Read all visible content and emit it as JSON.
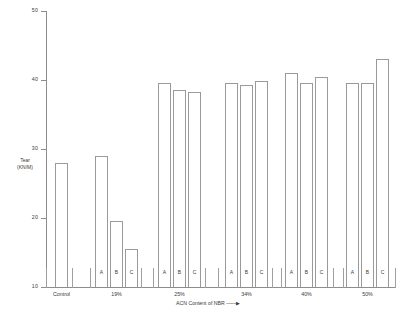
{
  "chart_data": {
    "type": "bar",
    "title": "",
    "xlabel": "ACN Content of NBR",
    "ylabel": "Tear (KN/M)",
    "ylabel_lines": [
      "Tear",
      "(KN/M)"
    ],
    "ylim": [
      10,
      50
    ],
    "yticks": [
      10,
      20,
      30,
      40,
      50
    ],
    "ytick_labels": [
      "10",
      "20",
      "30",
      "40",
      "50"
    ],
    "grid": false,
    "legend": "none",
    "xaxis_arrow": "——▶",
    "series_labels": [
      "A",
      "B",
      "C"
    ],
    "groups": [
      {
        "label": "Control",
        "bars": [
          {
            "sublabel": "",
            "value": 28.0
          }
        ]
      },
      {
        "label": "19%",
        "bars": [
          {
            "sublabel": "A",
            "value": 29.0
          },
          {
            "sublabel": "B",
            "value": 19.5
          },
          {
            "sublabel": "C",
            "value": 15.5
          }
        ]
      },
      {
        "label": "25%",
        "bars": [
          {
            "sublabel": "A",
            "value": 39.5
          },
          {
            "sublabel": "B",
            "value": 38.5
          },
          {
            "sublabel": "C",
            "value": 38.3
          }
        ]
      },
      {
        "label": "34%",
        "bars": [
          {
            "sublabel": "A",
            "value": 39.5
          },
          {
            "sublabel": "B",
            "value": 39.3
          },
          {
            "sublabel": "C",
            "value": 39.8
          }
        ]
      },
      {
        "label": "40%",
        "bars": [
          {
            "sublabel": "A",
            "value": 41.0
          },
          {
            "sublabel": "B",
            "value": 39.5
          },
          {
            "sublabel": "C",
            "value": 40.5
          }
        ]
      },
      {
        "label": "50%",
        "bars": [
          {
            "sublabel": "A",
            "value": 39.5
          },
          {
            "sublabel": "B",
            "value": 39.5
          },
          {
            "sublabel": "C",
            "value": 43.0
          }
        ]
      }
    ],
    "colors": {
      "bar_fill": "#ffffff",
      "bar_stroke": "#9a9a9a",
      "axis": "#8d8d8d",
      "text": "#3a3a3a",
      "background": "#ffffff"
    }
  }
}
